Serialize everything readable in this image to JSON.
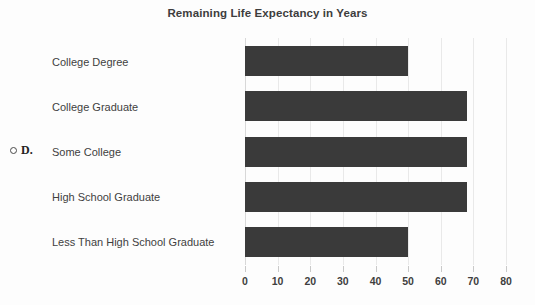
{
  "option": {
    "radio_icon": "radio-unselected-icon",
    "letter": "D.",
    "selected": false
  },
  "colors": {
    "bar": "#3a3a3a",
    "gridline": "#e9e9e9",
    "axis": "#d8d8d8",
    "text": "#3f3f3f",
    "background": "#fdfdfd"
  },
  "chart_data": {
    "type": "bar",
    "orientation": "horizontal",
    "title": "Remaining Life Expectancy in Years",
    "xlabel": "",
    "ylabel": "",
    "categories": [
      "College Degree",
      "College Graduate",
      "Some College",
      "High School Graduate",
      "Less Than High School Graduate"
    ],
    "values": [
      50,
      68,
      68,
      68,
      50
    ],
    "xlim": [
      0,
      80
    ],
    "xticks": [
      0,
      10,
      20,
      30,
      40,
      50,
      60,
      70,
      80
    ],
    "xtick_labels": [
      "0",
      "10",
      "20",
      "30",
      "40",
      "50",
      "60",
      "70",
      "80"
    ],
    "grid": true,
    "grid_axis": "x",
    "legend": false,
    "legend_position": "none",
    "series": [
      {
        "name": "Remaining Life Expectancy in Years",
        "values": [
          50,
          68,
          68,
          68,
          50
        ]
      }
    ]
  }
}
